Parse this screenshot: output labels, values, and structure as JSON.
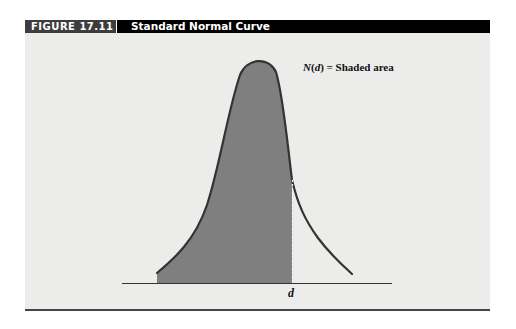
{
  "figure": {
    "number": "FIGURE 17.11",
    "title": "Standard Normal Curve"
  },
  "diagram": {
    "curve_name": "Standard normal curve",
    "area_label_prefix": "N(d)",
    "area_label": "N(d) = Shaded area",
    "x_marker_label": "d",
    "colors": {
      "shade": "#7f7f7f",
      "curve": "#333333",
      "background": "#ececea",
      "header": "#000000",
      "header_number_bg": "#3d3d3d"
    }
  }
}
